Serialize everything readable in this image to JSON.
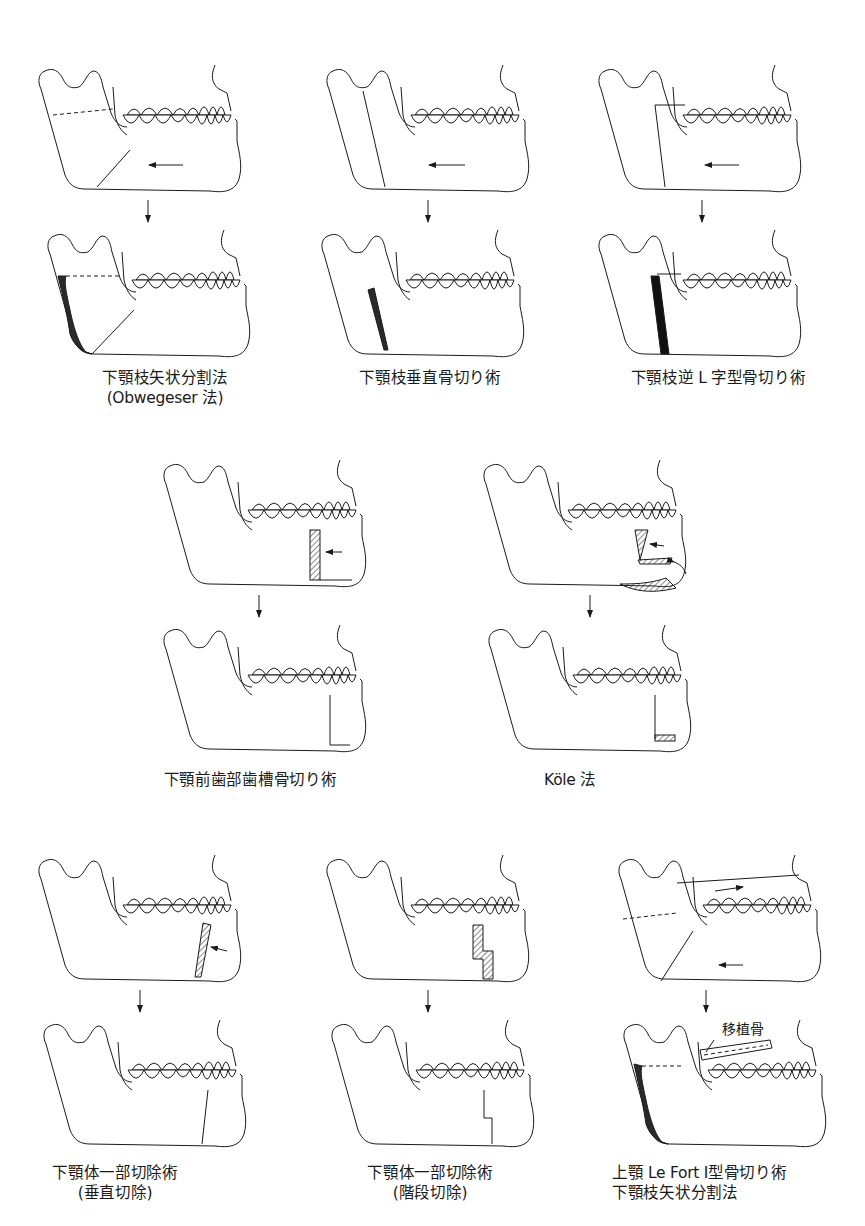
{
  "page": {
    "page_number_faint": "",
    "colors": {
      "ink": "#1a1a1a",
      "background": "#ffffff",
      "graft_fill": "#2a2a2a"
    }
  },
  "procedures": [
    {
      "id": "sagittal-split",
      "caption": [
        "下顎枝矢状分割法",
        "(Obwegeser 法)"
      ]
    },
    {
      "id": "vertical-ramus",
      "caption": [
        "下顎枝垂直骨切り術"
      ]
    },
    {
      "id": "inverted-L",
      "caption": [
        "下顎枝逆 L 字型骨切り術"
      ]
    },
    {
      "id": "anterior-alveolar",
      "caption": [
        "下顎前歯部歯槽骨切り術"
      ]
    },
    {
      "id": "kole",
      "caption": [
        "Köle 法"
      ]
    },
    {
      "id": "body-vertical",
      "caption": [
        "下顎体一部切除術",
        "(垂直切除)"
      ]
    },
    {
      "id": "body-step",
      "caption": [
        "下顎体一部切除術",
        "(階段切除)"
      ]
    },
    {
      "id": "lefort-sagittal",
      "caption": [
        "上顎 Le Fort Ⅰ型骨切り術",
        "下顎枝矢状分割法"
      ],
      "graft_label": "移植骨"
    }
  ]
}
